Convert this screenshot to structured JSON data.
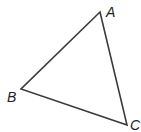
{
  "diagram": {
    "type": "triangle",
    "vertices": [
      {
        "label": "A",
        "x": 100,
        "y": 12
      },
      {
        "label": "B",
        "x": 21,
        "y": 89
      },
      {
        "label": "C",
        "x": 127,
        "y": 125
      }
    ],
    "stroke_color": "#3a3a3a",
    "label_color": "#222222"
  }
}
